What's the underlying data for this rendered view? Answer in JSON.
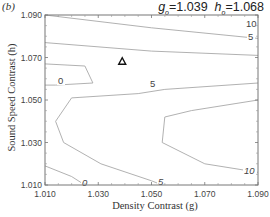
{
  "panel_label": "(b)",
  "params": {
    "g_symbol": "g",
    "g_sub": "o",
    "g_value": "=1.039",
    "h_symbol": "h",
    "h_sub": "o",
    "h_value": "=1.068"
  },
  "chart_data": {
    "type": "contour",
    "xlabel": "Density Contrast (g)",
    "ylabel": "Sound Speed Contrast (h)",
    "xlim": [
      1.01,
      1.09
    ],
    "ylim": [
      1.01,
      1.09
    ],
    "x_ticks": [
      "1.010",
      "1.030",
      "1.050",
      "1.070",
      "1.090"
    ],
    "y_ticks": [
      "1.010",
      "1.030",
      "1.050",
      "1.070",
      "1.090"
    ],
    "grid": false,
    "marker": {
      "shape": "triangle",
      "g": 1.039,
      "h": 1.068
    },
    "contours": [
      {
        "level": 10,
        "label": "10",
        "points": [
          [
            1.01,
            1.09
          ],
          [
            1.05,
            1.084
          ],
          [
            1.09,
            1.079
          ]
        ]
      },
      {
        "level": 5,
        "label": "5",
        "points": [
          [
            1.01,
            1.077
          ],
          [
            1.05,
            1.073
          ],
          [
            1.09,
            1.071
          ]
        ]
      },
      {
        "level": 0,
        "label": "0",
        "points": [
          [
            1.01,
            1.067
          ],
          [
            1.025,
            1.066
          ],
          [
            1.028,
            1.058
          ],
          [
            1.014,
            1.057
          ],
          [
            1.01,
            1.057
          ]
        ]
      },
      {
        "level": 5,
        "label": "5",
        "points": [
          [
            1.09,
            1.058
          ],
          [
            1.055,
            1.055
          ],
          [
            1.045,
            1.053
          ],
          [
            1.02,
            1.051
          ],
          [
            1.014,
            1.04
          ],
          [
            1.017,
            1.03
          ],
          [
            1.031,
            1.02
          ],
          [
            1.05,
            1.012
          ],
          [
            1.054,
            1.01
          ]
        ]
      },
      {
        "level": 0,
        "label": "0",
        "points": [
          [
            1.01,
            1.019
          ],
          [
            1.02,
            1.014
          ],
          [
            1.025,
            1.01
          ]
        ]
      },
      {
        "level": 10,
        "label": "10",
        "points": [
          [
            1.09,
            1.05
          ],
          [
            1.065,
            1.045
          ],
          [
            1.055,
            1.042
          ],
          [
            1.054,
            1.03
          ],
          [
            1.07,
            1.02
          ],
          [
            1.09,
            1.016
          ]
        ]
      }
    ]
  }
}
